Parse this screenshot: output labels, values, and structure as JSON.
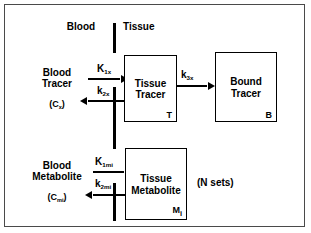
{
  "diagram": {
    "region_labels": {
      "blood": "Blood",
      "tissue": "Tissue"
    },
    "annotations": {
      "n_sets": "(N sets)"
    },
    "compartments": [
      {
        "id": "blood-tracer",
        "line1": "Blood",
        "line2": "Tracer",
        "concentration": "(C",
        "concentration_sub": "x",
        "concentration_close": ")"
      },
      {
        "id": "tissue-tracer",
        "line1": "Tissue",
        "line2": "Tracer",
        "corner": "T"
      },
      {
        "id": "bound-tracer",
        "line1": "Bound",
        "line2": "Tracer",
        "corner": "B"
      },
      {
        "id": "blood-metabolite",
        "line1": "Blood",
        "line2": "Metabolite",
        "concentration": "(C",
        "concentration_sub": "mi",
        "concentration_close": ")"
      },
      {
        "id": "tissue-metabolite",
        "line1": "Tissue",
        "line2": "Metabolite",
        "corner": "M",
        "corner_sub": "i"
      }
    ],
    "rate_constants": [
      {
        "id": "K1x",
        "base": "K",
        "sub": "1x",
        "direction": "blood-to-tissue"
      },
      {
        "id": "k2x",
        "base": "k",
        "sub": "2x",
        "direction": "tissue-to-blood"
      },
      {
        "id": "k3x",
        "base": "k",
        "sub": "3x",
        "direction": "tissue-to-bound"
      },
      {
        "id": "K1mi",
        "base": "K",
        "sub": "1mi",
        "direction": "blood-to-tissue"
      },
      {
        "id": "k2mi",
        "base": "k",
        "sub": "2mi",
        "direction": "tissue-to-blood"
      }
    ],
    "colors": {
      "stroke": "#000000",
      "frame": "#4a4a4a",
      "background": "#ffffff"
    }
  }
}
